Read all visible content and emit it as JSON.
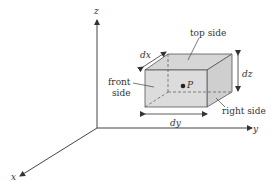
{
  "diagram": {
    "type": "3d-volume-element",
    "axes": {
      "x": "x",
      "y": "y",
      "z": "z"
    },
    "box": {
      "point_label": "P",
      "dimensions": {
        "dx": "dx",
        "dy": "dy",
        "dz": "dz"
      },
      "face_labels": {
        "top": "top side",
        "front_line1": "front",
        "front_line2": "side",
        "right": "right side"
      }
    },
    "colors": {
      "box_fill": "#dcdcdc",
      "line": "#333333",
      "background": "#ffffff"
    }
  }
}
